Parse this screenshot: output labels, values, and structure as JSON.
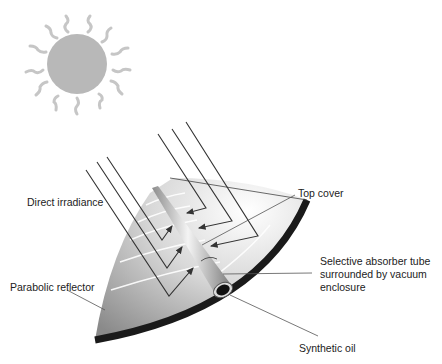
{
  "diagram": {
    "type": "parabolic trough solar collector",
    "labels": {
      "direct_irradiance": "Direct irradiance",
      "top_cover": "Top cover",
      "absorber_line1": "Selective absorber tube",
      "absorber_line2": "surrounded by vacuum",
      "absorber_line3": "enclosure",
      "parabolic_reflector": "Parabolic reflector",
      "synthetic_oil": "Synthetic oil"
    },
    "colors": {
      "sun": "#b5b5b5",
      "sun_rays": "#c4c4c4",
      "reflector_light": "#f2f2f2",
      "reflector_dark": "#8f8f8f",
      "rim": "#1a1a1a",
      "ray_lines": "#333333"
    }
  }
}
